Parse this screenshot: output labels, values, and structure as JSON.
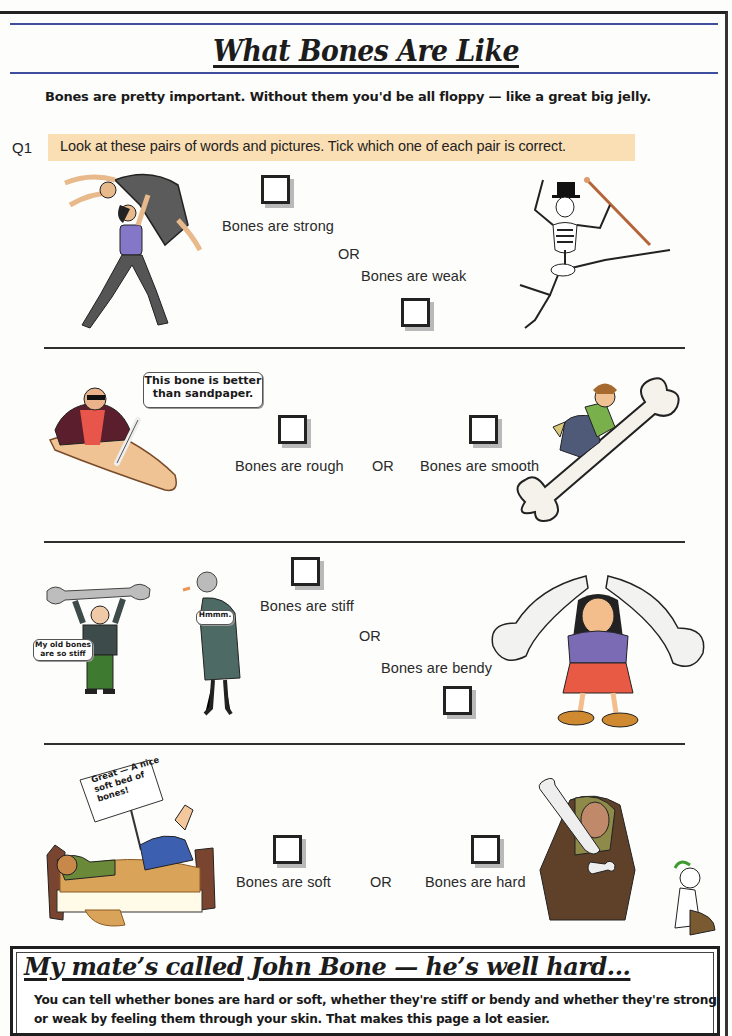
{
  "page": {
    "title": "What Bones Are Like",
    "intro": "Bones are pretty important.  Without them you'd be all floppy — like a great big jelly."
  },
  "question": {
    "number": "Q1",
    "instruction": "Look at these pairs of words and pictures.  Tick which one of each pair is correct.",
    "pairs": [
      {
        "option_a": {
          "label": "Bones are strong",
          "checked": false
        },
        "separator": "OR",
        "option_b": {
          "label": "Bones are weak",
          "checked": false
        },
        "illustration_left": "dancer-lift-illustration",
        "illustration_right": "dancing-skeleton-illustration"
      },
      {
        "option_a": {
          "label": "Bones are rough",
          "checked": false
        },
        "separator": "OR",
        "option_b": {
          "label": "Bones are smooth",
          "checked": false
        },
        "illustration_left": "man-sanding-with-bone-illustration",
        "illustration_right": "boy-sliding-down-bone-illustration",
        "speech_bubble": "This bone is better than sandpaper."
      },
      {
        "option_a": {
          "label": "Bones are stiff",
          "checked": false
        },
        "separator": "OR",
        "option_b": {
          "label": "Bones are bendy",
          "checked": false
        },
        "illustration_left": "old-man-and-old-woman-illustration",
        "illustration_right": "woman-bending-bone-illustration",
        "speech_bubbles": [
          "My old bones are so stiff",
          "Hmmm."
        ]
      },
      {
        "option_a": {
          "label": "Bones are soft",
          "checked": false
        },
        "separator": "OR",
        "option_b": {
          "label": "Bones are hard",
          "checked": false
        },
        "illustration_left": "man-on-bed-of-bones-illustration",
        "illustration_right": "caveman-bonking-illustration",
        "sign_text": "Great — A nice soft bed of bones!"
      }
    ]
  },
  "footer": {
    "title": "My mate’s called John Bone — he’s well hard...",
    "text": "You can tell whether bones are hard or soft, whether they're stiff or bendy and whether they're strong or weak by feeling them through your skin.  That makes this page a lot easier."
  },
  "colors": {
    "rule_blue": "#3f4f9f",
    "banner_bg": "#fbdfb4",
    "text": "#1a1a1a"
  }
}
